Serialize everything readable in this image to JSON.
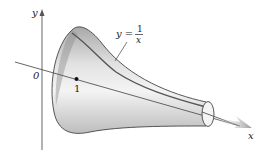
{
  "figure": {
    "type": "3d-surface-of-revolution",
    "labels": {
      "y_axis": "y",
      "x_axis": "x",
      "origin": "0",
      "tick_one": "1",
      "curve_lhs": "y =",
      "curve_num": "1",
      "curve_den": "x"
    },
    "colors": {
      "surface_light": "#f2f2f2",
      "surface_dark": "#9a9a9a",
      "outline": "#444444",
      "axis": "#555555",
      "arrow": "#9a9a9a"
    }
  }
}
